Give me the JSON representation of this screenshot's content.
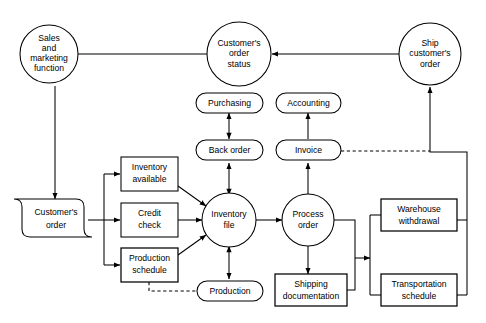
{
  "diagram": {
    "background_color": "#ffffff",
    "line_color": "#000000",
    "width": 486,
    "height": 323,
    "nodes": [
      {
        "id": "sales",
        "shape": "circle",
        "label": "Sales\nand\nmarketing\nfunction",
        "lines": [
          "Sales",
          "and",
          "marketing",
          "function"
        ]
      },
      {
        "id": "order_status",
        "shape": "circle",
        "label": "Customer's\norder\nstatus",
        "lines": [
          "Customer's",
          "order",
          "status"
        ]
      },
      {
        "id": "ship_order",
        "shape": "circle",
        "label": "Ship\ncustomer's\norder",
        "lines": [
          "Ship",
          "customer's",
          "order"
        ]
      },
      {
        "id": "purchasing",
        "shape": "stadium",
        "label": "Purchasing",
        "lines": [
          "Purchasing"
        ]
      },
      {
        "id": "accounting",
        "shape": "stadium",
        "label": "Accounting",
        "lines": [
          "Accounting"
        ]
      },
      {
        "id": "back_order",
        "shape": "stadium",
        "label": "Back order",
        "lines": [
          "Back order"
        ]
      },
      {
        "id": "invoice",
        "shape": "stadium",
        "label": "Invoice",
        "lines": [
          "Invoice"
        ]
      },
      {
        "id": "customers_order",
        "shape": "document",
        "label": "Customer's\norder",
        "lines": [
          "Customer's",
          "order"
        ]
      },
      {
        "id": "inventory_avail",
        "shape": "rectangle",
        "label": "Inventory\navailable",
        "lines": [
          "Inventory",
          "available"
        ]
      },
      {
        "id": "credit_check",
        "shape": "rectangle",
        "label": "Credit\ncheck",
        "lines": [
          "Credit",
          "check"
        ]
      },
      {
        "id": "prod_schedule",
        "shape": "rectangle",
        "label": "Production\nschedule",
        "lines": [
          "Production",
          "schedule"
        ]
      },
      {
        "id": "inventory_file",
        "shape": "circle",
        "label": "Inventory\nfile",
        "lines": [
          "Inventory",
          "file"
        ]
      },
      {
        "id": "process_order",
        "shape": "circle",
        "label": "Process\norder",
        "lines": [
          "Process",
          "order"
        ]
      },
      {
        "id": "production",
        "shape": "stadium",
        "label": "Production",
        "lines": [
          "Production"
        ]
      },
      {
        "id": "shipping_doc",
        "shape": "rectangle",
        "label": "Shipping\ndocumentation",
        "lines": [
          "Shipping",
          "documentation"
        ]
      },
      {
        "id": "warehouse",
        "shape": "rectangle",
        "label": "Warehouse\nwithdrawal",
        "lines": [
          "Warehouse",
          "withdrawal"
        ]
      },
      {
        "id": "transportation",
        "shape": "rectangle",
        "label": "Transportation\nschedule",
        "lines": [
          "Transportation",
          "schedule"
        ]
      }
    ],
    "edges": [
      {
        "from": "sales",
        "to": "order_status",
        "style": "solid",
        "arrow": "none"
      },
      {
        "from": "ship_order",
        "to": "order_status",
        "style": "solid",
        "arrow": "single"
      },
      {
        "from": "sales",
        "to": "customers_order",
        "style": "solid",
        "arrow": "single"
      },
      {
        "from": "customers_order",
        "to": "inventory_avail",
        "style": "solid",
        "arrow": "single"
      },
      {
        "from": "customers_order",
        "to": "credit_check",
        "style": "solid",
        "arrow": "single"
      },
      {
        "from": "customers_order",
        "to": "prod_schedule",
        "style": "solid",
        "arrow": "single"
      },
      {
        "from": "inventory_avail",
        "to": "inventory_file",
        "style": "solid",
        "arrow": "single"
      },
      {
        "from": "credit_check",
        "to": "inventory_file",
        "style": "solid",
        "arrow": "single"
      },
      {
        "from": "prod_schedule",
        "to": "inventory_file",
        "style": "solid",
        "arrow": "single"
      },
      {
        "from": "inventory_file",
        "to": "back_order",
        "style": "solid",
        "arrow": "double"
      },
      {
        "from": "back_order",
        "to": "purchasing",
        "style": "solid",
        "arrow": "double"
      },
      {
        "from": "inventory_file",
        "to": "production",
        "style": "solid",
        "arrow": "double"
      },
      {
        "from": "prod_schedule",
        "to": "production",
        "style": "dashed",
        "arrow": "none"
      },
      {
        "from": "inventory_file",
        "to": "process_order",
        "style": "solid",
        "arrow": "single"
      },
      {
        "from": "process_order",
        "to": "invoice",
        "style": "solid",
        "arrow": "single"
      },
      {
        "from": "invoice",
        "to": "accounting",
        "style": "solid",
        "arrow": "single"
      },
      {
        "from": "process_order",
        "to": "shipping_doc",
        "style": "solid",
        "arrow": "single"
      },
      {
        "from": "process_order",
        "to": "warehouse_bus",
        "style": "solid",
        "arrow": "single"
      },
      {
        "from": "shipping_doc",
        "to": "warehouse_bus",
        "style": "solid",
        "arrow": "single"
      },
      {
        "from": "warehouse",
        "to": "ship_order",
        "style": "solid",
        "arrow": "single"
      },
      {
        "from": "transportation",
        "to": "ship_order",
        "style": "solid",
        "arrow": "single"
      },
      {
        "from": "invoice",
        "to": "ship_order",
        "style": "dashed",
        "arrow": "none"
      }
    ]
  }
}
